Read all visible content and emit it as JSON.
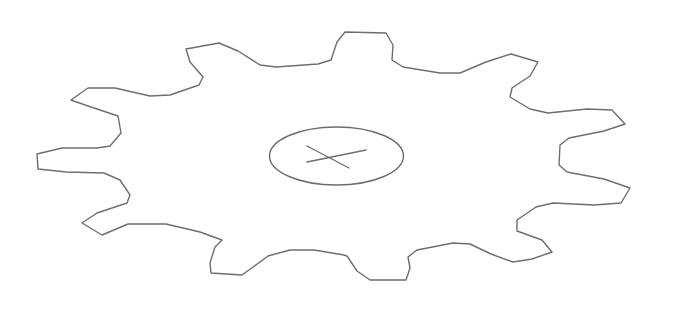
{
  "figure": {
    "stroke_color": "#6e6e6e",
    "background_color": "#ffffff",
    "stroke_width": 1.4,
    "gear": {
      "teeth_count": 12,
      "outline_points": [
        [
          345,
          32
        ],
        [
          386,
          33
        ],
        [
          393,
          45
        ],
        [
          392,
          60
        ],
        [
          403,
          67
        ],
        [
          440,
          73
        ],
        [
          460,
          73
        ],
        [
          486,
          62
        ],
        [
          511,
          54
        ],
        [
          538,
          62
        ],
        [
          530,
          76
        ],
        [
          512,
          88
        ],
        [
          510,
          97
        ],
        [
          530,
          109
        ],
        [
          548,
          113
        ],
        [
          587,
          109
        ],
        [
          612,
          110
        ],
        [
          625,
          124
        ],
        [
          604,
          131
        ],
        [
          569,
          138
        ],
        [
          560,
          145
        ],
        [
          559,
          165
        ],
        [
          567,
          172
        ],
        [
          604,
          179
        ],
        [
          630,
          188
        ],
        [
          621,
          203
        ],
        [
          594,
          205
        ],
        [
          553,
          203
        ],
        [
          536,
          207
        ],
        [
          517,
          220
        ],
        [
          517,
          231
        ],
        [
          542,
          240
        ],
        [
          552,
          252
        ],
        [
          532,
          259
        ],
        [
          513,
          262
        ],
        [
          491,
          254
        ],
        [
          470,
          244
        ],
        [
          453,
          243
        ],
        [
          417,
          250
        ],
        [
          408,
          257
        ],
        [
          410,
          268
        ],
        [
          406,
          280
        ],
        [
          370,
          280
        ],
        [
          357,
          271
        ],
        [
          347,
          256
        ],
        [
          344,
          255
        ],
        [
          314,
          250
        ],
        [
          290,
          250
        ],
        [
          268,
          256
        ],
        [
          253,
          267
        ],
        [
          242,
          275
        ],
        [
          211,
          273
        ],
        [
          210,
          263
        ],
        [
          215,
          247
        ],
        [
          222,
          240
        ],
        [
          200,
          232
        ],
        [
          166,
          224
        ],
        [
          128,
          224
        ],
        [
          102,
          235
        ],
        [
          82,
          223
        ],
        [
          97,
          213
        ],
        [
          127,
          203
        ],
        [
          130,
          195
        ],
        [
          120,
          180
        ],
        [
          104,
          173
        ],
        [
          66,
          172
        ],
        [
          38,
          169
        ],
        [
          37,
          154
        ],
        [
          62,
          148
        ],
        [
          97,
          148
        ],
        [
          110,
          146
        ],
        [
          121,
          133
        ],
        [
          118,
          116
        ],
        [
          88,
          106
        ],
        [
          71,
          100
        ],
        [
          88,
          88
        ],
        [
          115,
          88
        ],
        [
          150,
          96
        ],
        [
          170,
          95
        ],
        [
          199,
          85
        ],
        [
          203,
          77
        ],
        [
          190,
          62
        ],
        [
          186,
          49
        ],
        [
          219,
          43
        ],
        [
          238,
          51
        ],
        [
          260,
          65
        ],
        [
          276,
          67
        ],
        [
          318,
          64
        ],
        [
          331,
          60
        ],
        [
          337,
          42
        ]
      ]
    },
    "bore": {
      "shape": "ellipse",
      "cx": 336.5,
      "cy": 156,
      "rx": 67,
      "ry": 29,
      "cross": {
        "line_a": [
          307,
          146,
          349,
          168
        ],
        "line_b": [
          307,
          162,
          366,
          150
        ]
      }
    }
  },
  "labels": {
    "alt_text": "Gear outline drawing"
  }
}
